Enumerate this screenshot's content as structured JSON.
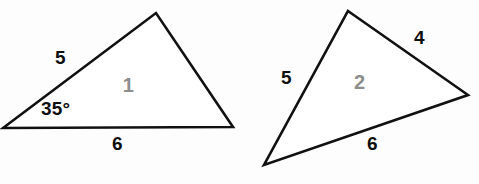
{
  "figure": {
    "background_color": "#fdfdfd",
    "stroke_color": "#111111",
    "label_color": "#0f0f0f",
    "interior_label_color": "#8d8d8d",
    "shapes": [
      {
        "name": "triangle-one",
        "interior_label": "1",
        "vertices": [
          {
            "name": "left-vertex",
            "x": 3,
            "y": 128
          },
          {
            "name": "apex-vertex",
            "x": 156,
            "y": 13
          },
          {
            "name": "right-vertex",
            "x": 233,
            "y": 127
          }
        ],
        "side_labels": [
          {
            "name": "side-label-left",
            "text": "5",
            "x": 55,
            "y": 48
          },
          {
            "name": "side-label-bottom",
            "text": "6",
            "x": 112,
            "y": 134
          }
        ],
        "angle_labels": [
          {
            "name": "angle-label-35",
            "text": "35°",
            "x": 41,
            "y": 99
          }
        ]
      },
      {
        "name": "triangle-two",
        "interior_label": "2",
        "vertices": [
          {
            "name": "apex-vertex",
            "x": 348,
            "y": 11
          },
          {
            "name": "right-vertex",
            "x": 468,
            "y": 95
          },
          {
            "name": "bottom-left-vertex",
            "x": 264,
            "y": 165
          }
        ],
        "side_labels": [
          {
            "name": "side-label-left",
            "text": "5",
            "x": 281,
            "y": 68
          },
          {
            "name": "side-label-upper-right",
            "text": "4",
            "x": 414,
            "y": 28
          },
          {
            "name": "side-label-bottom",
            "text": "6",
            "x": 367,
            "y": 134
          }
        ],
        "angle_labels": []
      }
    ]
  },
  "chart_data": {
    "type": "diagram",
    "subtitle": "",
    "xlabel": "",
    "ylabel": "",
    "legend": [],
    "grid": false,
    "annotations": [
      "Triangle 1: sides labeled 5 and 6 with included angle 35°",
      "Triangle 2: sides labeled 5, 4 and 6"
    ],
    "shapes": [
      {
        "label": "1",
        "type": "triangle",
        "labeled_sides": [
          {
            "side": "left",
            "length": 5
          },
          {
            "side": "bottom",
            "length": 6
          }
        ],
        "labeled_angles": [
          {
            "vertex": "left",
            "degrees": 35
          }
        ]
      },
      {
        "label": "2",
        "type": "triangle",
        "labeled_sides": [
          {
            "side": "left",
            "length": 5
          },
          {
            "side": "upper-right",
            "length": 4
          },
          {
            "side": "bottom",
            "length": 6
          }
        ],
        "labeled_angles": []
      }
    ]
  }
}
